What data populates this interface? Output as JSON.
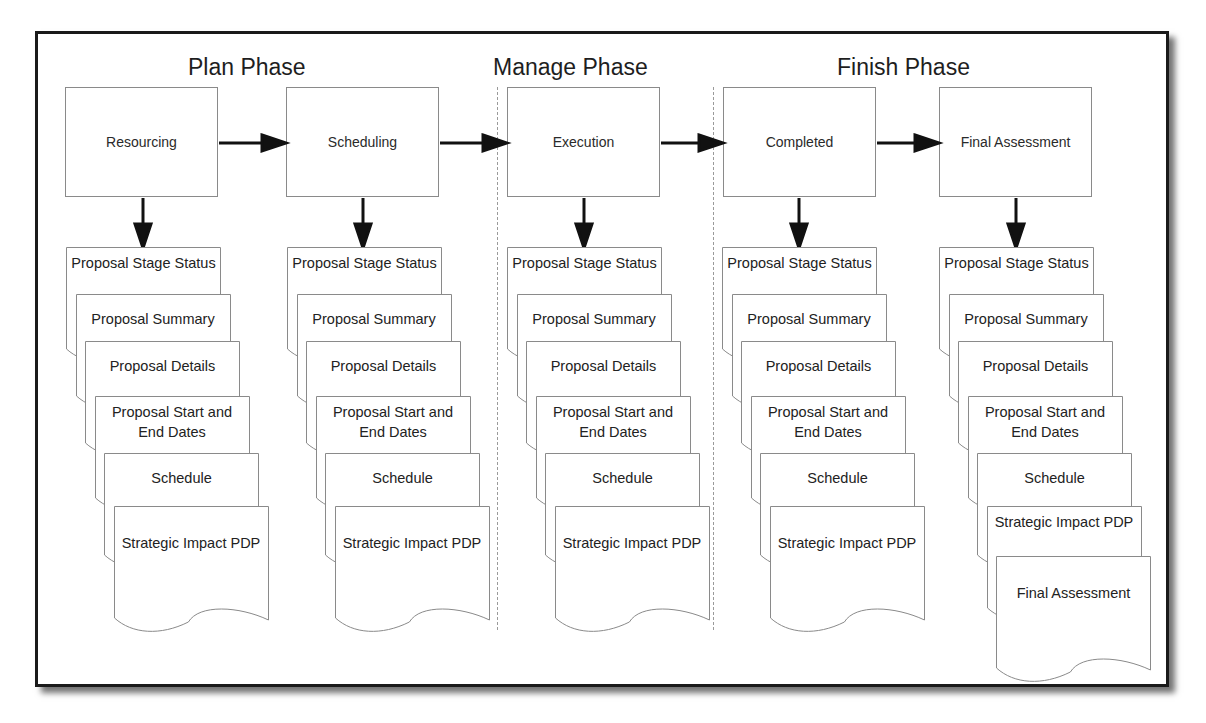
{
  "diagram": {
    "phases": [
      {
        "label": "Plan Phase"
      },
      {
        "label": "Manage Phase"
      },
      {
        "label": "Finish Phase"
      }
    ],
    "stages": [
      {
        "label": "Resourcing",
        "documents": [
          "Proposal Stage Status",
          "Proposal Summary",
          "Proposal Details",
          "Proposal Start and End Dates",
          "Schedule",
          "Strategic Impact PDP"
        ]
      },
      {
        "label": "Scheduling",
        "documents": [
          "Proposal Stage Status",
          "Proposal Summary",
          "Proposal Details",
          "Proposal Start and End Dates",
          "Schedule",
          "Strategic Impact PDP"
        ]
      },
      {
        "label": "Execution",
        "documents": [
          "Proposal Stage Status",
          "Proposal Summary",
          "Proposal Details",
          "Proposal Start and End Dates",
          "Schedule",
          "Strategic Impact PDP"
        ]
      },
      {
        "label": "Completed",
        "documents": [
          "Proposal Stage Status",
          "Proposal Summary",
          "Proposal Details",
          "Proposal Start and End Dates",
          "Schedule",
          "Strategic Impact PDP"
        ]
      },
      {
        "label": "Final Assessment",
        "documents": [
          "Proposal Stage Status",
          "Proposal Summary",
          "Proposal Details",
          "Proposal Start and End Dates",
          "Schedule",
          "Strategic Impact PDP",
          "Final Assessment"
        ]
      }
    ],
    "flow": [
      "Resourcing -> Scheduling",
      "Scheduling -> Execution",
      "Execution -> Completed",
      "Completed -> Final Assessment"
    ],
    "colors": {
      "frame_border": "#1a1a1a",
      "box_border": "#8a8a8a",
      "arrow": "#111111",
      "divider": "#9a9a9a",
      "text": "#222222"
    }
  }
}
